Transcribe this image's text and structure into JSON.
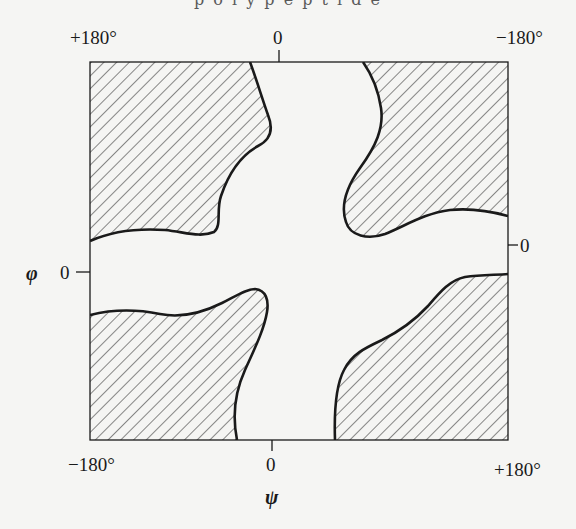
{
  "figure": {
    "top_fragment": "p o l y p e p t i d e",
    "top_axis": {
      "left_label": "+180°",
      "center_label": "0",
      "right_label": "−180°"
    },
    "bottom_axis": {
      "left_label": "−180°",
      "center_label": "0",
      "right_label": "+180°",
      "symbol": "ψ"
    },
    "left_axis": {
      "symbol": "φ",
      "zero_label": "0"
    },
    "right_axis": {
      "zero_label": "0"
    },
    "regions": [
      {
        "name": "top-left",
        "fill": "hatched"
      },
      {
        "name": "top-right",
        "fill": "hatched"
      },
      {
        "name": "bottom-left",
        "fill": "hatched"
      },
      {
        "name": "bottom-right",
        "fill": "hatched"
      }
    ],
    "colors": {
      "line": "#1a1a1a",
      "hatch": "#2a2a2a",
      "background": "#f5f5f3"
    }
  }
}
